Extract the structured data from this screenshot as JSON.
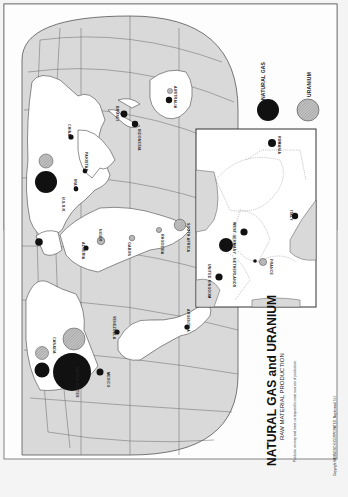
{
  "map": {
    "title": "NATURAL GAS and URANIUM",
    "subtitle": "RAW MATERIAL PRODUCTION",
    "note": "Products on map and inset correspond to main sources of production.",
    "copyright": "Copyright HAMMOND INCORPORATED, Maplewood, N.J.",
    "orientation": "rotated 90° clockwise (page reads bottom-to-top)",
    "colors": {
      "ocean": "#d9d9d9",
      "land": "#ffffff",
      "natural_gas": "#111111",
      "uranium": "#a8a8a8",
      "border": "#555555"
    }
  },
  "legend": {
    "items": [
      {
        "label": "NATURAL GAS",
        "symbol": "solid-black-circle"
      },
      {
        "label": "URANIUM",
        "symbol": "hatched-gray-circle"
      }
    ]
  },
  "labels": {
    "usa": "UNITED STATES",
    "canada": "CANADA",
    "mexico": "MEXICO",
    "venezuela": "VENEZUELA",
    "argentina": "ARGENTINA",
    "ussr": "U.S.S.R.",
    "china": "CHINA",
    "pakistan": "PAKISTAN",
    "iran": "IRAN",
    "brunei": "BRUNEI",
    "indonesia": "INDONESIA",
    "australia": "AUSTRALIA",
    "algeria": "ALGERIA",
    "niger": "NIGER",
    "gabon": "GABON",
    "rhodesia": "RHODESIA",
    "south_africa": "SOUTH AFRICA"
  },
  "inset": {
    "region": "Europe",
    "labels": {
      "rumania": "RUMANIA",
      "west_germany": "WEST GERMANY",
      "italy": "ITALY",
      "netherlands": "NETHERLANDS",
      "united_kingdom": "UNITED KINGDOM",
      "france": "FRANCE"
    }
  },
  "markers": [
    {
      "place": "United States",
      "gas": "largest",
      "uranium": "large"
    },
    {
      "place": "Canada",
      "gas": "medium",
      "uranium": "medium"
    },
    {
      "place": "Mexico",
      "gas": "small"
    },
    {
      "place": "Venezuela",
      "gas": "small"
    },
    {
      "place": "Argentina",
      "gas": "small"
    },
    {
      "place": "U.S.S.R.",
      "gas": "large",
      "uranium": "medium"
    },
    {
      "place": "China",
      "gas": "small"
    },
    {
      "place": "Pakistan",
      "gas": "small"
    },
    {
      "place": "Iran",
      "gas": "small"
    },
    {
      "place": "Brunei",
      "gas": "small"
    },
    {
      "place": "Indonesia",
      "gas": "small"
    },
    {
      "place": "Australia",
      "gas": "small",
      "uranium": "small"
    },
    {
      "place": "Algeria",
      "gas": "small"
    },
    {
      "place": "Niger",
      "uranium": "small"
    },
    {
      "place": "Gabon",
      "uranium": "small"
    },
    {
      "place": "Rhodesia",
      "uranium": "small"
    },
    {
      "place": "South Africa",
      "uranium": "medium"
    },
    {
      "place": "Rumania",
      "gas": "small"
    },
    {
      "place": "West Germany",
      "gas": "small"
    },
    {
      "place": "Italy",
      "gas": "small"
    },
    {
      "place": "Netherlands",
      "gas": "medium"
    },
    {
      "place": "United Kingdom",
      "gas": "small"
    },
    {
      "place": "France",
      "gas": "small",
      "uranium": "small"
    }
  ]
}
